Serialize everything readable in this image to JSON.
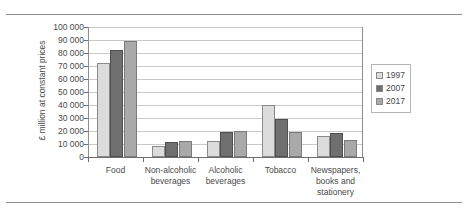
{
  "chart_data": {
    "type": "bar",
    "title": "",
    "subtitle": "",
    "xlabel": "",
    "ylabel": "£ million at constant prices",
    "ylim": [
      0,
      100000
    ],
    "ytick_labels": [
      "100 000",
      "90 000",
      "80 000",
      "70 000",
      "60 000",
      "50 000",
      "40 000",
      "30 000",
      "20 000",
      "10 000",
      "0"
    ],
    "ytick_values": [
      100000,
      90000,
      80000,
      70000,
      60000,
      50000,
      40000,
      30000,
      20000,
      10000,
      0
    ],
    "grid": true,
    "legend_position": "right",
    "categories": [
      "Food",
      "Non-alcoholic beverages",
      "Alcoholic beverages",
      "Tobacco",
      "Newspapers, books and stationery"
    ],
    "category_label_lines": [
      [
        "Food"
      ],
      [
        "Non-alcoholic",
        "beverages"
      ],
      [
        "Alcoholic",
        "beverages"
      ],
      [
        "Tobacco"
      ],
      [
        "Newspapers,",
        "books and",
        "stationery"
      ]
    ],
    "series": [
      {
        "name": "1997",
        "color": "#dcdcdc",
        "values": [
          72000,
          8500,
          12500,
          40000,
          16500
        ]
      },
      {
        "name": "2007",
        "color": "#6f6f6f",
        "values": [
          82500,
          11500,
          19000,
          29000,
          18500
        ]
      },
      {
        "name": "2017",
        "color": "#a9a9a9",
        "values": [
          89000,
          12000,
          20000,
          19500,
          13000
        ]
      }
    ]
  },
  "legend": {
    "items": [
      {
        "label": "1997"
      },
      {
        "label": "2007"
      },
      {
        "label": "2017"
      }
    ]
  }
}
